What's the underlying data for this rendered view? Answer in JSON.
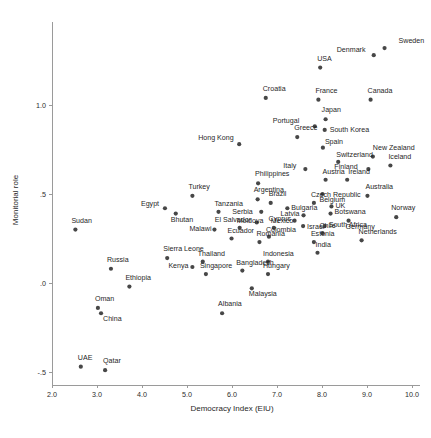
{
  "chart_data": {
    "type": "scatter",
    "title": "",
    "xlabel": "Democracy Index (EIU)",
    "ylabel": "Monitorial role",
    "xlim": [
      2.0,
      10.0
    ],
    "ylim": [
      -0.62,
      1.45
    ],
    "xticks": [
      "2.0",
      "3.0",
      "4.0",
      "5.0",
      "6.0",
      "7.0",
      "8.0",
      "9.0",
      "10.0"
    ],
    "xtickvalues": [
      2.0,
      3.0,
      4.0,
      5.0,
      6.0,
      7.0,
      8.0,
      9.0,
      10.0
    ],
    "yticks": [
      "1.0",
      ".5",
      ".0",
      "-.5"
    ],
    "ytickvalues": [
      1.0,
      0.5,
      0.0,
      -0.5
    ],
    "grid": false,
    "legend": false,
    "marker_color": "#474747",
    "axis_color": "#9a9a9a",
    "points": [
      {
        "label": "Sweden",
        "x": 9.39,
        "y": 1.32,
        "lx": 14,
        "ly": -5
      },
      {
        "label": "Denmark",
        "x": 9.15,
        "y": 1.28,
        "lx": -37,
        "ly": -3
      },
      {
        "label": "USA",
        "x": 7.96,
        "y": 1.21,
        "lx": -3,
        "ly": -7
      },
      {
        "label": "Croatia",
        "x": 6.75,
        "y": 1.04,
        "lx": -3,
        "ly": -7
      },
      {
        "label": "France",
        "x": 7.92,
        "y": 1.03,
        "lx": -3,
        "ly": -7
      },
      {
        "label": "Canada",
        "x": 9.08,
        "y": 1.03,
        "lx": -3,
        "ly": -7
      },
      {
        "label": "Japan",
        "x": 8.08,
        "y": 0.92,
        "lx": -4,
        "ly": -7
      },
      {
        "label": "Portugal",
        "x": 7.84,
        "y": 0.88,
        "lx": -42,
        "ly": -3
      },
      {
        "label": "South Korea",
        "x": 8.06,
        "y": 0.86,
        "lx": 5,
        "ly": 2
      },
      {
        "label": "Greece",
        "x": 7.45,
        "y": 0.82,
        "lx": -3,
        "ly": -7
      },
      {
        "label": "Hong Kong",
        "x": 6.16,
        "y": 0.78,
        "lx": -41,
        "ly": -4
      },
      {
        "label": "Spain",
        "x": 8.02,
        "y": 0.76,
        "lx": 2,
        "ly": -4
      },
      {
        "label": "New Zealand",
        "x": 9.13,
        "y": 0.71,
        "lx": 0,
        "ly": -7
      },
      {
        "label": "Switzerland",
        "x": 8.36,
        "y": 0.68,
        "lx": -2,
        "ly": -5
      },
      {
        "label": "Iceland",
        "x": 9.52,
        "y": 0.66,
        "lx": -2,
        "ly": -7
      },
      {
        "label": "Italy",
        "x": 7.63,
        "y": 0.64,
        "lx": -22,
        "ly": -1
      },
      {
        "label": "Finland",
        "x": 9.03,
        "y": 0.64,
        "lx": -34,
        "ly": 0
      },
      {
        "label": "Austria",
        "x": 8.08,
        "y": 0.58,
        "lx": -3,
        "ly": -6
      },
      {
        "label": "Ireland",
        "x": 8.56,
        "y": 0.58,
        "lx": 1,
        "ly": -6
      },
      {
        "label": "Philippines",
        "x": 6.58,
        "y": 0.56,
        "lx": -3,
        "ly": -7
      },
      {
        "label": "Belgium",
        "x": 8.01,
        "y": 0.5,
        "lx": -3,
        "ly": 8
      },
      {
        "label": "Australia",
        "x": 9.01,
        "y": 0.49,
        "lx": -2,
        "ly": -7
      },
      {
        "label": "Turkey",
        "x": 5.12,
        "y": 0.49,
        "lx": -4,
        "ly": -7
      },
      {
        "label": "Argentina",
        "x": 6.57,
        "y": 0.47,
        "lx": -4,
        "ly": -7
      },
      {
        "label": "Brazil",
        "x": 6.86,
        "y": 0.45,
        "lx": -2,
        "ly": -7
      },
      {
        "label": "Czech Republic",
        "x": 7.82,
        "y": 0.45,
        "lx": -3,
        "ly": -6
      },
      {
        "label": "UK",
        "x": 8.21,
        "y": 0.43,
        "lx": 4,
        "ly": 2
      },
      {
        "label": "Egypt",
        "x": 4.51,
        "y": 0.42,
        "lx": -24,
        "ly": -2
      },
      {
        "label": "Bulgaria",
        "x": 7.23,
        "y": 0.42,
        "lx": 4,
        "ly": 2
      },
      {
        "label": "Serbia",
        "x": 6.65,
        "y": 0.4,
        "lx": -29,
        "ly": 2
      },
      {
        "label": "Tanzania",
        "x": 5.7,
        "y": 0.4,
        "lx": -4,
        "ly": -6
      },
      {
        "label": "Bhutan",
        "x": 4.75,
        "y": 0.39,
        "lx": -5,
        "ly": 8
      },
      {
        "label": "Botswana",
        "x": 8.19,
        "y": 0.39,
        "lx": 4,
        "ly": 0
      },
      {
        "label": "Latvia",
        "x": 7.59,
        "y": 0.38,
        "lx": -23,
        "ly": 1
      },
      {
        "label": "Norway",
        "x": 9.65,
        "y": 0.37,
        "lx": -5,
        "ly": -7
      },
      {
        "label": "Germany",
        "x": 8.59,
        "y": 0.35,
        "lx": -3,
        "ly": 8
      },
      {
        "label": "Cyprus",
        "x": 7.39,
        "y": 0.35,
        "lx": -26,
        "ly": 0
      },
      {
        "label": "El Salvador",
        "x": 6.55,
        "y": 0.34,
        "lx": -42,
        "ly": 0
      },
      {
        "label": "Israel",
        "x": 7.58,
        "y": 0.32,
        "lx": 4,
        "ly": 3
      },
      {
        "label": "South Africa",
        "x": 8.06,
        "y": 0.32,
        "lx": 4,
        "ly": 1
      },
      {
        "label": "Mexico",
        "x": 6.93,
        "y": 0.31,
        "lx": -3,
        "ly": -5
      },
      {
        "label": "Moldova",
        "x": 6.17,
        "y": 0.31,
        "lx": -3,
        "ly": -5
      },
      {
        "label": "Malawi",
        "x": 5.61,
        "y": 0.3,
        "lx": -25,
        "ly": 1
      },
      {
        "label": "Chile",
        "x": 8.01,
        "y": 0.28,
        "lx": -3,
        "ly": -5
      },
      {
        "label": "Colombia",
        "x": 6.82,
        "y": 0.26,
        "lx": -3,
        "ly": -5
      },
      {
        "label": "Ecuador",
        "x": 5.99,
        "y": 0.25,
        "lx": -4,
        "ly": -6
      },
      {
        "label": "Romania",
        "x": 6.61,
        "y": 0.23,
        "lx": -3,
        "ly": -6
      },
      {
        "label": "Netherlands",
        "x": 8.88,
        "y": 0.24,
        "lx": -3,
        "ly": -6
      },
      {
        "label": "Estonia",
        "x": 7.82,
        "y": 0.23,
        "lx": -3,
        "ly": -6
      },
      {
        "label": "India",
        "x": 7.9,
        "y": 0.17,
        "lx": -2,
        "ly": -6
      },
      {
        "label": "Sierra Leone",
        "x": 4.56,
        "y": 0.14,
        "lx": -4,
        "ly": -7
      },
      {
        "label": "Thailand",
        "x": 5.35,
        "y": 0.12,
        "lx": -5,
        "ly": -6
      },
      {
        "label": "Indonesia",
        "x": 6.8,
        "y": 0.12,
        "lx": -5,
        "ly": -6
      },
      {
        "label": "Kenya",
        "x": 5.12,
        "y": 0.09,
        "lx": -24,
        "ly": 1
      },
      {
        "label": "Russia",
        "x": 3.31,
        "y": 0.08,
        "lx": -4,
        "ly": -7
      },
      {
        "label": "Bangladesh",
        "x": 6.23,
        "y": 0.07,
        "lx": -6,
        "ly": -6
      },
      {
        "label": "Singapore",
        "x": 5.42,
        "y": 0.05,
        "lx": -6,
        "ly": -6
      },
      {
        "label": "Hungary",
        "x": 6.8,
        "y": 0.05,
        "lx": -5,
        "ly": -6
      },
      {
        "label": "Ethiopia",
        "x": 3.72,
        "y": -0.02,
        "lx": -4,
        "ly": -7
      },
      {
        "label": "Malaysia",
        "x": 6.44,
        "y": -0.03,
        "lx": -3,
        "ly": 8
      },
      {
        "label": "Oman",
        "x": 3.02,
        "y": -0.14,
        "lx": -3,
        "ly": -7
      },
      {
        "label": "China",
        "x": 3.09,
        "y": -0.17,
        "lx": 2,
        "ly": 8
      },
      {
        "label": "Albania",
        "x": 5.78,
        "y": -0.17,
        "lx": -4,
        "ly": -7
      },
      {
        "label": "UAE",
        "x": 2.64,
        "y": -0.47,
        "lx": -3,
        "ly": -7
      },
      {
        "label": "Qatar",
        "x": 3.18,
        "y": -0.49,
        "lx": -2,
        "ly": -7
      },
      {
        "label": "Sudan",
        "x": 2.52,
        "y": 0.3,
        "lx": -4,
        "ly": -7
      }
    ]
  }
}
